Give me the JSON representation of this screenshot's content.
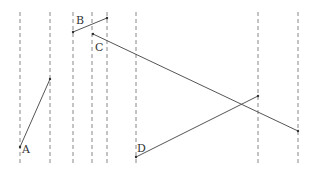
{
  "diagram": {
    "dashed_lines_x": [
      20,
      50,
      73,
      92,
      107,
      136,
      258,
      298
    ],
    "dashed_top": 12,
    "dashed_bottom": 163,
    "segments": [
      {
        "label": "A",
        "x1": 20,
        "y1": 147,
        "x2": 50,
        "y2": 79,
        "label_x": 22,
        "label_y": 153
      },
      {
        "label": "B",
        "x1": 73,
        "y1": 32,
        "x2": 107,
        "y2": 18,
        "label_x": 76,
        "label_y": 24
      },
      {
        "label": "C",
        "x1": 93,
        "y1": 34,
        "x2": 298,
        "y2": 131,
        "label_x": 95,
        "label_y": 51
      },
      {
        "label": "D",
        "x1": 136,
        "y1": 157,
        "x2": 258,
        "y2": 96,
        "label_x": 137,
        "label_y": 152
      }
    ],
    "line_color": "#555555",
    "dash_color": "#888888"
  }
}
